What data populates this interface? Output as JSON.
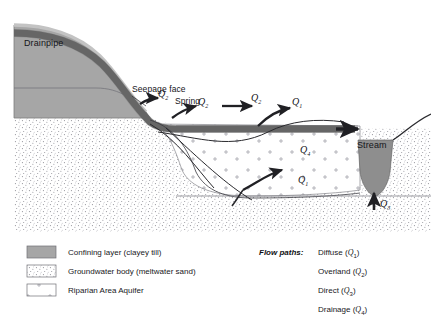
{
  "figure": {
    "type": "hydrogeology-cross-section",
    "background": "#ffffff"
  },
  "colors": {
    "confining_layer": "#a6a6a6",
    "confining_layer_edge": "#7d7d7d",
    "drainpipe": "#6f6f6f",
    "drainpipe_edge": "#4a4a4a",
    "stream_water": "#8e8e8e",
    "groundwater_stipple": "#8a8a92",
    "riparian_tick": "#9a9aa2",
    "arrow": "#202024",
    "line": "#2a2a2e",
    "text": "#18181c"
  },
  "scene_labels": {
    "drainpipe": "Drainpipe",
    "seepage_face": "Seepage face",
    "spring": "Spring",
    "stream": "Stream"
  },
  "flow_arrows": [
    {
      "id": "q2-seepage",
      "symbol": "Q",
      "subscript": "2",
      "x": 158,
      "y": 93,
      "note": "seepage face outflow"
    },
    {
      "id": "q2-spring",
      "symbol": "Q",
      "subscript": "2",
      "x": 198,
      "y": 100,
      "note": "spring outflow"
    },
    {
      "id": "q2-overland",
      "symbol": "Q",
      "subscript": "2",
      "x": 250,
      "y": 96,
      "note": "overland flow"
    },
    {
      "id": "q1-upper",
      "symbol": "Q",
      "subscript": "1",
      "x": 291,
      "y": 100,
      "note": "diffuse flow upper"
    },
    {
      "id": "q4-drain",
      "symbol": "Q",
      "subscript": "4",
      "x": 300,
      "y": 146,
      "note": "drainage via drainpipe"
    },
    {
      "id": "q1-lower",
      "symbol": "Q",
      "subscript": "1",
      "x": 300,
      "y": 178,
      "note": "diffuse flow lower"
    },
    {
      "id": "q3-stream",
      "symbol": "Q",
      "subscript": "3",
      "x": 381,
      "y": 200,
      "note": "direct discharge to stream"
    }
  ],
  "legend_materials": {
    "items": [
      {
        "key": "confining",
        "label": "Confining layer (clayey till)",
        "swatch": "solid-gray"
      },
      {
        "key": "groundwater",
        "label": "Groundwater body (meltwater sand)",
        "swatch": "dotted"
      },
      {
        "key": "riparian",
        "label": "Riparian Area Aquifer",
        "swatch": "ticks"
      }
    ]
  },
  "legend_flowpaths": {
    "heading": "Flow paths:",
    "items": [
      {
        "name": "Diffuse",
        "symbol": "Q",
        "subscript": "1"
      },
      {
        "name": "Overland",
        "symbol": "Q",
        "subscript": "2"
      },
      {
        "name": "Direct",
        "symbol": "Q",
        "subscript": "3"
      },
      {
        "name": "Drainage",
        "symbol": "Q",
        "subscript": "4"
      }
    ]
  }
}
